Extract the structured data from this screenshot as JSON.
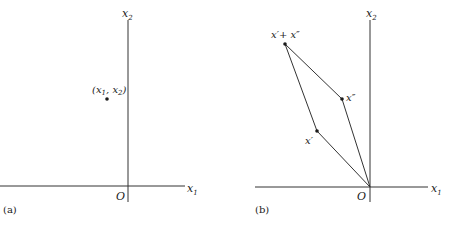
{
  "panels": [
    {
      "caption": "(a)",
      "axes": {
        "x_label": "x",
        "x_sub": "1",
        "y_label": "x",
        "y_sub": "2",
        "origin": "O"
      },
      "point": {
        "label_open": "(",
        "label_x": "x",
        "label_sub1": "1",
        "label_sep": ", ",
        "label_x2": "x",
        "label_sub2": "2",
        "label_close": ")"
      }
    },
    {
      "caption": "(b)",
      "axes": {
        "x_label": "x",
        "x_sub": "1",
        "y_label": "x",
        "y_sub": "2",
        "origin": "O"
      },
      "points": {
        "sum": "x′+ x″",
        "x_double_prime": "x″",
        "x_prime": "x′"
      }
    }
  ],
  "colors": {
    "ink": "#1a1a1a",
    "background": "#ffffff"
  }
}
